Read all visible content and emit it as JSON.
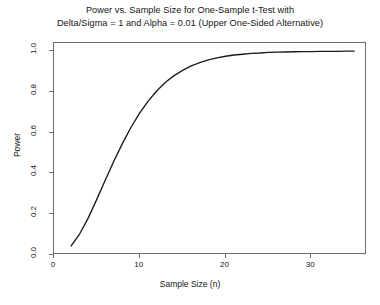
{
  "chart_data": {
    "type": "line",
    "title": "Power vs. Sample Size for One-Sample t-Test with Delta/Sigma = 1 and Alpha = 0.01 (Upper One-Sided Alternative)",
    "title_line1": "Power vs. Sample Size for One-Sample t-Test with",
    "title_line2": "Delta/Sigma = 1 and Alpha = 0.01 (Upper One-Sided Alternative)",
    "xlabel": "Sample Size (n)",
    "ylabel": "Power",
    "xlim": [
      0,
      36.5
    ],
    "ylim": [
      0.0,
      1.04
    ],
    "grid": false,
    "legend": false,
    "line_color": "#1a1a1a",
    "axis_color": "#6e6e6e",
    "background": "#ffffff",
    "xticks": [
      0,
      10,
      20,
      30
    ],
    "xtick_labels": [
      "0",
      "10",
      "20",
      "30"
    ],
    "yticks": [
      0.0,
      0.2,
      0.4,
      0.6,
      0.8,
      1.0
    ],
    "ytick_labels": [
      "0.0",
      "0.2",
      "0.4",
      "0.6",
      "0.8",
      "1.0"
    ],
    "series": [
      {
        "name": "Power",
        "x": [
          2,
          3,
          4,
          5,
          6,
          7,
          8,
          9,
          10,
          11,
          12,
          13,
          14,
          15,
          16,
          17,
          18,
          19,
          20,
          21,
          22,
          23,
          24,
          25,
          26,
          27,
          28,
          29,
          30,
          31,
          32,
          33,
          34,
          35
        ],
        "values": [
          0.045,
          0.104,
          0.182,
          0.274,
          0.369,
          0.462,
          0.549,
          0.628,
          0.697,
          0.756,
          0.806,
          0.847,
          0.88,
          0.906,
          0.928,
          0.944,
          0.957,
          0.967,
          0.975,
          0.981,
          0.985,
          0.989,
          0.991,
          0.994,
          0.995,
          0.996,
          0.997,
          0.998,
          0.998,
          0.999,
          0.999,
          0.999,
          1.0,
          1.0
        ]
      }
    ]
  }
}
